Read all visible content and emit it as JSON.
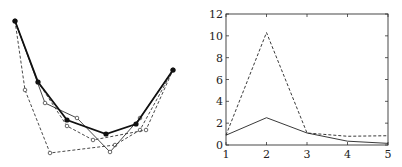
{
  "chart_data": [
    {
      "type": "line",
      "title": "",
      "xlabel": "",
      "ylabel": "",
      "axes_visible": false,
      "grid": false,
      "note": "Unlabeled polyline plot: several curves sharing endpoints, U-shaped, coordinates in pixel space",
      "series": [
        {
          "name": "bold-filled-markers",
          "style": "solid-bold",
          "marker": "filled-circle",
          "points": [
            [
              15,
              21
            ],
            [
              38,
              82
            ],
            [
              67,
              120
            ],
            [
              106,
              134
            ],
            [
              136,
              124
            ],
            [
              173,
              70
            ]
          ]
        },
        {
          "name": "thin-open-markers",
          "style": "solid-thin",
          "marker": "open-circle",
          "points": [
            [
              15,
              21
            ],
            [
              45,
              103
            ],
            [
              77,
              118
            ],
            [
              110,
              152
            ],
            [
              140,
              118
            ],
            [
              173,
              70
            ]
          ]
        },
        {
          "name": "dashed-a",
          "style": "dashed",
          "marker": "open-circle",
          "points": [
            [
              15,
              21
            ],
            [
              25,
              90
            ],
            [
              50,
              153
            ],
            [
              115,
              145
            ],
            [
              140,
              130
            ],
            [
              173,
              70
            ]
          ]
        },
        {
          "name": "dashed-b",
          "style": "dashed",
          "marker": "open-circle",
          "points": [
            [
              15,
              21
            ],
            [
              38,
              82
            ],
            [
              67,
              126
            ],
            [
              93,
              140
            ],
            [
              146,
              130
            ],
            [
              173,
              70
            ]
          ]
        }
      ]
    },
    {
      "type": "line",
      "title": "",
      "xlabel": "",
      "ylabel": "",
      "x": [
        1,
        2,
        3,
        4,
        5
      ],
      "xlim": [
        1,
        5
      ],
      "ylim": [
        0,
        12
      ],
      "xticks": [
        "1",
        "2",
        "3",
        "4",
        "5"
      ],
      "yticks": [
        "0",
        "2",
        "4",
        "6",
        "8",
        "10",
        "12"
      ],
      "grid": false,
      "legend": null,
      "series": [
        {
          "name": "solid",
          "style": "solid",
          "values": [
            0.9,
            2.5,
            1.1,
            0.35,
            0.15
          ]
        },
        {
          "name": "dashed",
          "style": "dashed",
          "values": [
            0.9,
            10.3,
            1.1,
            0.8,
            0.85
          ]
        }
      ]
    }
  ]
}
